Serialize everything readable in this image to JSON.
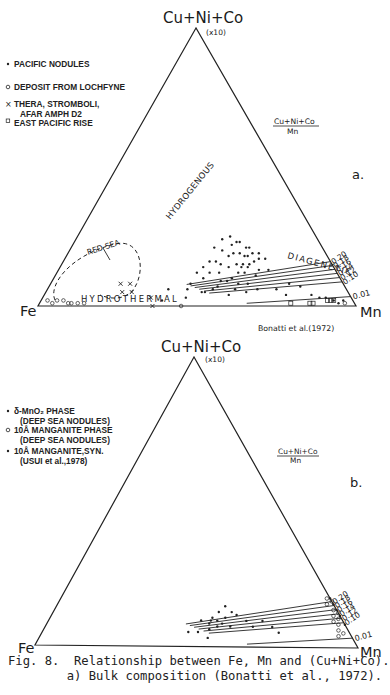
{
  "figure": {
    "caption_line1": "Fig. 8.  Relationship between Fe, Mn and (Cu+Ni+Co).",
    "caption_line2": "        a) Bulk composition (Bonatti et al., 1972)."
  },
  "chart_data": [
    {
      "type": "scatter",
      "subtype": "ternary",
      "panel_label": "a.",
      "vertices": {
        "top": "Cu+Ni+Co",
        "top_note": "(x10)",
        "left": "Fe",
        "right": "Mn"
      },
      "ratio_label": {
        "numerator": "Cu+Ni+Co",
        "denominator": "Mn"
      },
      "ratio_lines": [
        "0.20",
        "0.18",
        "0.16",
        "0.14",
        "0.12",
        "0.10",
        "0.01"
      ],
      "fields": [
        "HYDROGENOUS",
        "DIAGENETIC",
        "HYDROTHERMAL",
        "RED SEA"
      ],
      "source": "Bonatti et al.(1972)",
      "legend": [
        {
          "symbol": "dot",
          "label": "PACIFIC NODULES"
        },
        {
          "symbol": "open-circle",
          "label": "DEPOSIT FROM LOCHFYNE"
        },
        {
          "symbol": "cross",
          "label": "THERA, STROMBOLI,",
          "label2": "AFAR AMPH D2"
        },
        {
          "symbol": "open-square",
          "label": "EAST PACIFIC RISE"
        }
      ],
      "series": [
        {
          "name": "PACIFIC NODULES",
          "symbol": "dot",
          "points_fe_mn_cu": [
            [
              0.3,
              0.46,
              0.24
            ],
            [
              0.27,
              0.48,
              0.25
            ],
            [
              0.25,
              0.52,
              0.23
            ],
            [
              0.26,
              0.51,
              0.23
            ],
            [
              0.28,
              0.5,
              0.22
            ],
            [
              0.24,
              0.55,
              0.21
            ],
            [
              0.23,
              0.56,
              0.21
            ],
            [
              0.29,
              0.52,
              0.19
            ],
            [
              0.27,
              0.54,
              0.19
            ],
            [
              0.25,
              0.57,
              0.18
            ],
            [
              0.26,
              0.56,
              0.18
            ],
            [
              0.31,
              0.51,
              0.18
            ],
            [
              0.22,
              0.61,
              0.17
            ],
            [
              0.24,
              0.6,
              0.16
            ],
            [
              0.28,
              0.57,
              0.15
            ],
            [
              0.3,
              0.55,
              0.15
            ],
            [
              0.33,
              0.53,
              0.14
            ],
            [
              0.27,
              0.59,
              0.14
            ],
            [
              0.24,
              0.63,
              0.13
            ],
            [
              0.21,
              0.66,
              0.13
            ],
            [
              0.29,
              0.59,
              0.12
            ],
            [
              0.31,
              0.57,
              0.12
            ],
            [
              0.26,
              0.63,
              0.11
            ],
            [
              0.34,
              0.56,
              0.1
            ],
            [
              0.36,
              0.55,
              0.09
            ],
            [
              0.38,
              0.53,
              0.09
            ],
            [
              0.33,
              0.59,
              0.08
            ],
            [
              0.3,
              0.62,
              0.08
            ],
            [
              0.4,
              0.53,
              0.07
            ],
            [
              0.35,
              0.59,
              0.06
            ],
            [
              0.42,
              0.52,
              0.06
            ],
            [
              0.28,
              0.66,
              0.06
            ],
            [
              0.32,
              0.63,
              0.05
            ],
            [
              0.45,
              0.5,
              0.05
            ],
            [
              0.38,
              0.58,
              0.04
            ],
            [
              0.22,
              0.72,
              0.06
            ],
            [
              0.17,
              0.75,
              0.08
            ],
            [
              0.14,
              0.79,
              0.07
            ],
            [
              0.2,
              0.76,
              0.04
            ],
            [
              0.12,
              0.84,
              0.04
            ],
            [
              0.1,
              0.87,
              0.03
            ],
            [
              0.36,
              0.48,
              0.16
            ],
            [
              0.34,
              0.45,
              0.21
            ],
            [
              0.38,
              0.46,
              0.16
            ],
            [
              0.4,
              0.48,
              0.12
            ],
            [
              0.43,
              0.47,
              0.1
            ],
            [
              0.29,
              0.57,
              0.14
            ],
            [
              0.26,
              0.59,
              0.15
            ],
            [
              0.23,
              0.58,
              0.19
            ],
            [
              0.21,
              0.6,
              0.19
            ],
            [
              0.2,
              0.63,
              0.17
            ],
            [
              0.32,
              0.48,
              0.2
            ],
            [
              0.35,
              0.5,
              0.15
            ],
            [
              0.37,
              0.51,
              0.12
            ],
            [
              0.48,
              0.44,
              0.08
            ],
            [
              0.5,
              0.44,
              0.06
            ],
            [
              0.46,
              0.49,
              0.05
            ],
            [
              0.52,
              0.45,
              0.03
            ],
            [
              0.41,
              0.45,
              0.14
            ],
            [
              0.44,
              0.44,
              0.12
            ],
            [
              0.06,
              0.92,
              0.02
            ],
            [
              0.05,
              0.94,
              0.01
            ],
            [
              0.08,
              0.89,
              0.03
            ],
            [
              0.03,
              0.95,
              0.02
            ],
            [
              0.6,
              0.38,
              0.02
            ],
            [
              0.56,
              0.38,
              0.06
            ]
          ]
        },
        {
          "name": "DEPOSIT FROM LOCHFYNE",
          "symbol": "open-circle",
          "points_fe_mn_cu": [
            [
              0.95,
              0.04,
              0.01
            ],
            [
              0.93,
              0.05,
              0.02
            ],
            [
              0.91,
              0.07,
              0.02
            ],
            [
              0.89,
              0.1,
              0.01
            ],
            [
              0.87,
              0.12,
              0.01
            ],
            [
              0.85,
              0.14,
              0.01
            ],
            [
              0.55,
              0.45,
              0.0
            ],
            [
              0.9,
              0.09,
              0.01
            ],
            [
              0.96,
              0.02,
              0.02
            ],
            [
              0.03,
              0.96,
              0.01
            ]
          ]
        },
        {
          "name": "THERA, STROMBOLI, AFAR AMPH D2",
          "symbol": "cross",
          "points_fe_mn_cu": [
            [
              0.7,
              0.22,
              0.08
            ],
            [
              0.67,
              0.25,
              0.08
            ],
            [
              0.71,
              0.24,
              0.05
            ],
            [
              0.68,
              0.27,
              0.05
            ],
            [
              0.63,
              0.34,
              0.03
            ],
            [
              0.64,
              0.36,
              0.0
            ]
          ]
        },
        {
          "name": "EAST PACIFIC RISE",
          "symbol": "open-square",
          "points_fe_mn_cu": [
            [
              0.2,
              0.79,
              0.01
            ],
            [
              0.14,
              0.85,
              0.01
            ],
            [
              0.13,
              0.86,
              0.01
            ],
            [
              0.07,
              0.91,
              0.02
            ],
            [
              0.06,
              0.92,
              0.02
            ],
            [
              0.08,
              0.9,
              0.02
            ]
          ]
        }
      ]
    },
    {
      "type": "scatter",
      "subtype": "ternary",
      "panel_label": "b.",
      "vertices": {
        "top": "Cu+Ni+Co",
        "top_note": "(x10)",
        "left": "Fe",
        "right": "Mn"
      },
      "ratio_label": {
        "numerator": "Cu+Ni+Co",
        "denominator": "Mn"
      },
      "ratio_lines": [
        "0.20",
        "0.18",
        "0.16",
        "0.14",
        "0.12",
        "0.10",
        "0.01"
      ],
      "legend": [
        {
          "symbol": "dot",
          "label": "δ-MnO₂ PHASE",
          "label2": "(DEEP SEA NODULES)"
        },
        {
          "symbol": "open-circle",
          "label": "10Å MANGANITE PHASE",
          "label2": "(DEEP SEA NODULES)"
        },
        {
          "symbol": "dot",
          "label": "10Å MANGANITE,SYN.",
          "label2": "(USUI et al.,1978)"
        }
      ],
      "series": [
        {
          "name": "δ-MnO2 PHASE (DEEP SEA NODULES)",
          "symbol": "dot",
          "points_fe_mn_cu": [
            [
              0.34,
              0.52,
              0.14
            ],
            [
              0.37,
              0.51,
              0.12
            ],
            [
              0.33,
              0.55,
              0.12
            ],
            [
              0.32,
              0.57,
              0.11
            ],
            [
              0.36,
              0.54,
              0.1
            ],
            [
              0.3,
              0.61,
              0.09
            ],
            [
              0.4,
              0.5,
              0.1
            ],
            [
              0.44,
              0.47,
              0.09
            ],
            [
              0.39,
              0.52,
              0.09
            ],
            [
              0.41,
              0.5,
              0.09
            ],
            [
              0.38,
              0.54,
              0.08
            ],
            [
              0.42,
              0.5,
              0.08
            ],
            [
              0.4,
              0.53,
              0.07
            ],
            [
              0.43,
              0.51,
              0.06
            ],
            [
              0.47,
              0.48,
              0.05
            ],
            [
              0.45,
              0.52,
              0.03
            ],
            [
              0.29,
              0.64,
              0.07
            ],
            [
              0.23,
              0.7,
              0.07
            ],
            [
              0.22,
              0.73,
              0.05
            ],
            [
              0.25,
              0.66,
              0.09
            ],
            [
              0.5,
              0.45,
              0.05
            ],
            [
              0.36,
              0.57,
              0.07
            ]
          ]
        },
        {
          "name": "10Å MANGANITE PHASE (DEEP SEA NODULES)",
          "symbol": "open-circle",
          "points_fe_mn_cu": [
            [
              0.0,
              0.84,
              0.16
            ],
            [
              0.02,
              0.83,
              0.15
            ],
            [
              0.01,
              0.86,
              0.13
            ],
            [
              0.0,
              0.88,
              0.12
            ],
            [
              0.02,
              0.87,
              0.11
            ],
            [
              0.01,
              0.89,
              0.1
            ],
            [
              0.03,
              0.88,
              0.09
            ],
            [
              0.02,
              0.9,
              0.08
            ],
            [
              0.03,
              0.91,
              0.06
            ],
            [
              0.02,
              0.93,
              0.05
            ],
            [
              0.04,
              0.92,
              0.04
            ],
            [
              0.01,
              0.82,
              0.17
            ]
          ]
        },
        {
          "name": "10Å MANGANITE,SYN. (USUI et al.,1978)",
          "symbol": "dot",
          "points_fe_mn_cu": [
            [
              0.0,
              0.83,
              0.17
            ],
            [
              0.0,
              0.85,
              0.15
            ],
            [
              0.0,
              0.87,
              0.13
            ],
            [
              0.0,
              0.89,
              0.11
            ],
            [
              0.0,
              0.92,
              0.08
            ]
          ]
        }
      ]
    }
  ]
}
